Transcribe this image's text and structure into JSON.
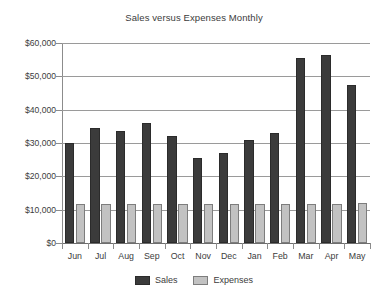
{
  "chart_data": {
    "type": "bar",
    "title": "Sales versus Expenses Monthly",
    "xlabel": "",
    "ylabel": "",
    "categories": [
      "Jun",
      "Jul",
      "Aug",
      "Sep",
      "Oct",
      "Nov",
      "Dec",
      "Jan",
      "Feb",
      "Mar",
      "Apr",
      "May"
    ],
    "series": [
      {
        "name": "Sales",
        "color": "#3b3b3b",
        "values": [
          30000,
          34500,
          33500,
          36000,
          32000,
          25500,
          27000,
          31000,
          33000,
          55500,
          56500,
          47500
        ]
      },
      {
        "name": "Expenses",
        "color": "#c2c2c2",
        "values": [
          11800,
          11700,
          11800,
          11800,
          11800,
          11800,
          11800,
          11800,
          11800,
          11800,
          11800,
          12000
        ]
      }
    ],
    "ylim": [
      0,
      60000
    ],
    "ytick_values": [
      60000,
      50000,
      40000,
      30000,
      20000,
      10000,
      0
    ],
    "ytick_labels": [
      "$60,000",
      "$50,000",
      "$40,000",
      "$30,000",
      "$20,000",
      "$10,000",
      "$0"
    ],
    "grid": true,
    "legend_position": "bottom"
  }
}
